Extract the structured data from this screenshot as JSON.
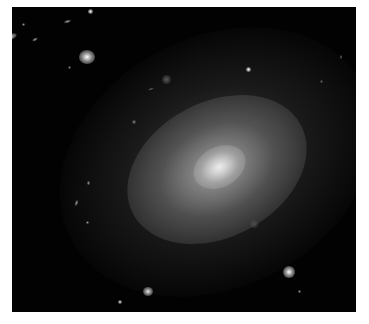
{
  "image": {
    "subject": "elliptical galaxy with surrounding background galaxies and stars",
    "background_color": "#020202",
    "border_color": "#ffffff"
  },
  "objects": [
    {
      "type": "galaxy-elongated",
      "x": 3,
      "y": 34,
      "w": 14,
      "h": 6,
      "rot": -20,
      "b": 0.85
    },
    {
      "type": "galaxy-bright",
      "x": 79,
      "y": 50,
      "w": 16,
      "h": 14,
      "rot": 0,
      "b": 1.0
    },
    {
      "type": "star",
      "x": 88,
      "y": 9,
      "w": 5,
      "h": 5,
      "rot": 0,
      "b": 1.0
    },
    {
      "type": "galaxy",
      "x": 64,
      "y": 20,
      "w": 7,
      "h": 3,
      "rot": -15,
      "b": 0.6
    },
    {
      "type": "galaxy",
      "x": 32,
      "y": 38,
      "w": 6,
      "h": 3,
      "rot": -30,
      "b": 0.6
    },
    {
      "type": "star",
      "x": 22,
      "y": 23,
      "w": 3,
      "h": 3,
      "rot": 0,
      "b": 0.6
    },
    {
      "type": "star",
      "x": 246,
      "y": 67,
      "w": 5,
      "h": 5,
      "rot": 0,
      "b": 1.0
    },
    {
      "type": "galaxy",
      "x": 162,
      "y": 75,
      "w": 9,
      "h": 9,
      "rot": 0,
      "b": 0.35
    },
    {
      "type": "star",
      "x": 132,
      "y": 120,
      "w": 4,
      "h": 4,
      "rot": 0,
      "b": 0.5
    },
    {
      "type": "galaxy-bright",
      "x": 283,
      "y": 266,
      "w": 12,
      "h": 12,
      "rot": 0,
      "b": 1.0
    },
    {
      "type": "galaxy-bright",
      "x": 143,
      "y": 287,
      "w": 10,
      "h": 9,
      "rot": 0,
      "b": 0.9
    },
    {
      "type": "star",
      "x": 118,
      "y": 300,
      "w": 4,
      "h": 4,
      "rot": 0,
      "b": 0.9
    },
    {
      "type": "star",
      "x": 87,
      "y": 181,
      "w": 3,
      "h": 4,
      "rot": 0,
      "b": 0.6
    },
    {
      "type": "galaxy",
      "x": 75,
      "y": 200,
      "w": 3,
      "h": 6,
      "rot": 20,
      "b": 0.6
    },
    {
      "type": "star",
      "x": 86,
      "y": 221,
      "w": 3,
      "h": 3,
      "rot": 0,
      "b": 0.6
    },
    {
      "type": "galaxy",
      "x": 250,
      "y": 220,
      "w": 8,
      "h": 8,
      "rot": 0,
      "b": 0.3
    },
    {
      "type": "star",
      "x": 298,
      "y": 290,
      "w": 3,
      "h": 3,
      "rot": 0,
      "b": 0.6
    },
    {
      "type": "star",
      "x": 320,
      "y": 80,
      "w": 3,
      "h": 3,
      "rot": 0,
      "b": 0.4
    },
    {
      "type": "galaxy",
      "x": 148,
      "y": 88,
      "w": 6,
      "h": 2,
      "rot": -20,
      "b": 0.4
    },
    {
      "type": "star",
      "x": 68,
      "y": 66,
      "w": 3,
      "h": 3,
      "rot": 0,
      "b": 0.5
    },
    {
      "type": "star",
      "x": 208,
      "y": 315,
      "w": 3,
      "h": 3,
      "rot": 0,
      "b": 0.4
    },
    {
      "type": "star",
      "x": 340,
      "y": 55,
      "w": 2,
      "h": 4,
      "rot": 0,
      "b": 0.5
    }
  ]
}
